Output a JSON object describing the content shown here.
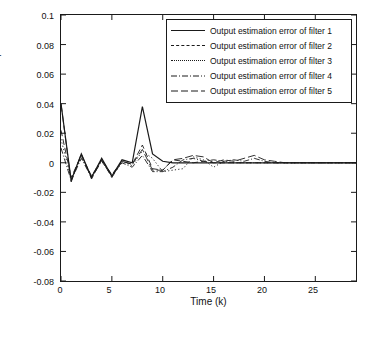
{
  "chart_data": {
    "type": "line",
    "title": "",
    "xlabel": "Time (k)",
    "ylabel": "Output estimation errors",
    "xlim": [
      0,
      29
    ],
    "ylim": [
      -0.08,
      0.1
    ],
    "xticks": [
      0,
      5,
      10,
      15,
      20,
      25
    ],
    "yticks": [
      -0.08,
      -0.06,
      -0.04,
      -0.02,
      0,
      0.02,
      0.04,
      0.06,
      0.08,
      0.1
    ],
    "ytick_labels": [
      "-0.08",
      "-0.06",
      "-0.04",
      "-0.02",
      "0",
      "0.02",
      "0.04",
      "0.06",
      "0.08",
      "0.1"
    ],
    "xtick_labels": [
      "0",
      "5",
      "10",
      "15",
      "20",
      "25"
    ],
    "grid": false,
    "legend_position": "upper right",
    "series": [
      {
        "name": "Output estimation error of filter 1",
        "style": "solid",
        "color": "#1a1a1a",
        "x": [
          0,
          1,
          2,
          3,
          4,
          5,
          6,
          7,
          8,
          9,
          10,
          11,
          12,
          13,
          14,
          15,
          16,
          17,
          18,
          19,
          20,
          21,
          22,
          23,
          24,
          25,
          26,
          27,
          28,
          29
        ],
        "values": [
          0.04,
          -0.012,
          0.006,
          -0.01,
          0.003,
          -0.009,
          0.002,
          0.0,
          0.038,
          0.006,
          0.001,
          0.0,
          0.0,
          0.0,
          0.0,
          0.0,
          0.0,
          0.0,
          0.0,
          0.0,
          0.0,
          0.0,
          0.0,
          0.0,
          0.0,
          0.0,
          0.0,
          0.0,
          0.0,
          0.0
        ]
      },
      {
        "name": "Output estimation error of filter 2",
        "style": "dashed",
        "color": "#1a1a1a",
        "x": [
          0,
          1,
          2,
          3,
          4,
          5,
          6,
          7,
          8,
          9,
          10,
          11,
          12,
          13,
          14,
          15,
          16,
          17,
          18,
          19,
          20,
          21,
          22,
          23,
          24,
          25,
          26,
          27,
          28,
          29
        ],
        "values": [
          0.022,
          -0.01,
          0.005,
          -0.009,
          0.002,
          -0.008,
          0.001,
          -0.001,
          0.012,
          -0.004,
          -0.005,
          0.002,
          0.001,
          0.0,
          0.001,
          0.0,
          0.0,
          0.0,
          0.0,
          0.0,
          0.0,
          0.0,
          0.0,
          0.0,
          0.0,
          0.0,
          0.0,
          0.0,
          0.0,
          0.0
        ]
      },
      {
        "name": "Output estimation error of filter 3",
        "style": "dotted",
        "color": "#1a1a1a",
        "x": [
          0,
          1,
          2,
          3,
          4,
          5,
          6,
          7,
          8,
          9,
          10,
          11,
          12,
          13,
          14,
          15,
          16,
          17,
          18,
          19,
          20,
          21,
          22,
          23,
          24,
          25,
          26,
          27,
          28,
          29
        ],
        "values": [
          0.016,
          -0.011,
          0.004,
          -0.009,
          0.002,
          -0.009,
          0.001,
          -0.002,
          0.008,
          0.003,
          -0.006,
          -0.005,
          -0.004,
          0.004,
          0.002,
          -0.003,
          0.001,
          0.0,
          0.0,
          0.0,
          0.0,
          0.0,
          0.0,
          0.0,
          0.0,
          0.0,
          0.0,
          0.0,
          0.0,
          0.0
        ]
      },
      {
        "name": "Output estimation error of filter 4",
        "style": "dashdot",
        "color": "#1a1a1a",
        "x": [
          0,
          1,
          2,
          3,
          4,
          5,
          6,
          7,
          8,
          9,
          10,
          11,
          12,
          13,
          14,
          15,
          16,
          17,
          18,
          19,
          20,
          21,
          22,
          23,
          24,
          25,
          26,
          27,
          28,
          29
        ],
        "values": [
          0.01,
          -0.012,
          0.003,
          -0.01,
          0.001,
          -0.009,
          0.0,
          -0.003,
          0.005,
          -0.006,
          -0.006,
          -0.003,
          0.002,
          0.003,
          0.001,
          0.002,
          0.001,
          0.002,
          0.001,
          0.003,
          0.001,
          0.0,
          0.0,
          0.0,
          0.0,
          0.0,
          0.0,
          0.0,
          0.0,
          0.0
        ]
      },
      {
        "name": "Output estimation error of filter 5",
        "style": "longdash",
        "color": "#1a1a1a",
        "x": [
          0,
          1,
          2,
          3,
          4,
          5,
          6,
          7,
          8,
          9,
          10,
          11,
          12,
          13,
          14,
          15,
          16,
          17,
          18,
          19,
          20,
          21,
          22,
          23,
          24,
          25,
          26,
          27,
          28,
          29
        ],
        "values": [
          0.04,
          -0.013,
          0.006,
          -0.011,
          0.002,
          -0.01,
          0.001,
          -0.001,
          0.009,
          -0.005,
          -0.005,
          0.002,
          0.003,
          0.005,
          0.004,
          0.0,
          0.002,
          0.001,
          0.003,
          0.005,
          0.002,
          0.001,
          0.0,
          0.0,
          0.0,
          0.0,
          0.0,
          0.0,
          0.0,
          0.0
        ]
      }
    ]
  },
  "legend": {
    "items": [
      "Output estimation error of filter 1",
      "Output estimation error of filter 2",
      "Output estimation error of filter 3",
      "Output estimation error of filter 4",
      "Output estimation error of filter 5"
    ]
  },
  "axes": {
    "xlabel": "Time (k)",
    "ylabel": "Output estimation errors"
  }
}
